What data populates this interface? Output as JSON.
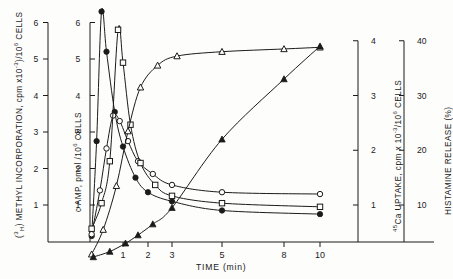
{
  "figure": {
    "background": "#fdfdfb",
    "ink": "#1b1b1b"
  },
  "axes": {
    "x": {
      "label": "TIME (min)",
      "ticks": [
        "1",
        "2",
        "3",
        "5",
        "8",
        "10"
      ],
      "tick_values": [
        1,
        2,
        3,
        5,
        8,
        10
      ],
      "tick_px": [
        123,
        148,
        172,
        222,
        284,
        320
      ]
    },
    "y1": {
      "label_parts": {
        "pre": "(",
        "sup1": "3",
        "sub1": "H",
        "mid": ") METHYL INCORPORATION, cpm x10",
        "sup2": "-3",
        "mid2": ")/10",
        "sup3": "6",
        "post": " CELLS"
      },
      "label_plain": "(3H) METHYL INCORPORATION, cpm x10-3)/106 CELLS",
      "ticks": [
        "1",
        "2",
        "3",
        "4",
        "5",
        "6"
      ],
      "tick_values": [
        1,
        2,
        3,
        4,
        5,
        6
      ],
      "axis_x_px": 48
    },
    "y2": {
      "label_parts": {
        "pre": "c AMP, pmol /10",
        "sup": "6",
        "post": " CELLS"
      },
      "label_plain": "c AMP, pmol /106 CELLS",
      "ticks": [
        "1",
        "2",
        "3",
        "4",
        "5",
        "6"
      ],
      "tick_values": [
        1,
        2,
        3,
        4,
        5,
        6
      ],
      "axis_x_px": 90
    },
    "y3": {
      "label_parts": {
        "sup_pre": "45",
        "pre": "Ca UPTAKE, cpm x 10",
        "sup": "-3",
        "mid": "/10",
        "sup2": "6",
        "post": " CELLS"
      },
      "label_plain": "45Ca UPTAKE, cpm x 10-3/106 CELLS",
      "ticks": [
        "1",
        "2",
        "3",
        "4"
      ],
      "tick_values": [
        1,
        2,
        3,
        4
      ],
      "axis_x_px": 358
    },
    "y4": {
      "label_plain": "HISTAMINE RELEASE (%)",
      "ticks": [
        "10",
        "20",
        "30",
        "40"
      ],
      "tick_values": [
        10,
        20,
        30,
        40
      ],
      "axis_x_px": 404
    }
  },
  "chart_data": {
    "type": "line",
    "title": "",
    "xlabel": "TIME (min)",
    "ylabel": "(3H) METHYL INCORPORATION, cpm x10-3)/106 CELLS",
    "xlim": [
      0,
      10
    ],
    "ylim": [
      0,
      6.5
    ],
    "grid": false,
    "legend": "none",
    "x_scale": "non-linear (compressed tail)",
    "series": [
      {
        "name": "cAMP",
        "marker": "filled-circle",
        "axis": "y2",
        "x": [
          0.05,
          0.2,
          0.35,
          0.5,
          0.75,
          1.0,
          1.5,
          2.0,
          3.0,
          5.0,
          10.0
        ],
        "y": [
          0.15,
          2.75,
          6.3,
          5.2,
          3.55,
          2.6,
          1.75,
          1.35,
          1.1,
          0.85,
          0.75
        ]
      },
      {
        "name": "(3H) methyl incorporation",
        "marker": "open-circle",
        "axis": "y1",
        "x": [
          0.05,
          0.3,
          0.5,
          0.7,
          0.9,
          1.2,
          1.6,
          2.2,
          3.0,
          5.0,
          10.0
        ],
        "y": [
          0.2,
          1.4,
          2.55,
          3.45,
          3.3,
          2.75,
          2.2,
          1.85,
          1.55,
          1.35,
          1.3
        ]
      },
      {
        "name": "methylation peak",
        "marker": "open-square",
        "axis": "y2",
        "x": [
          0.05,
          0.35,
          0.6,
          0.85,
          1.0,
          1.3,
          1.7,
          2.3,
          3.0,
          5.0,
          10.0
        ],
        "y": [
          0.35,
          1.05,
          2.2,
          5.8,
          4.9,
          3.2,
          2.15,
          1.55,
          1.25,
          1.05,
          0.95
        ]
      },
      {
        "name": "45Ca uptake",
        "marker": "open-triangle",
        "axis": "y3",
        "x": [
          0.05,
          0.4,
          0.8,
          1.2,
          1.7,
          2.4,
          3.2,
          5.0,
          8.0,
          10.0
        ],
        "y": [
          0.1,
          0.55,
          1.35,
          2.35,
          3.15,
          3.55,
          3.72,
          3.8,
          3.85,
          3.88
        ]
      },
      {
        "name": "histamine release",
        "marker": "filled-triangle",
        "axis": "y4",
        "x": [
          0.1,
          0.6,
          1.1,
          1.6,
          2.2,
          3.0,
          5.0,
          8.0,
          10.0
        ],
        "y": [
          0.5,
          1.5,
          3.0,
          4.5,
          6.5,
          9.5,
          22.0,
          33.0,
          39.0
        ]
      }
    ]
  }
}
